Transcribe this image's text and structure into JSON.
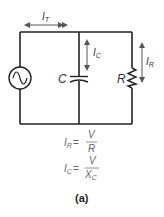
{
  "diagram": {
    "type": "parallel RC circuit",
    "labels": {
      "total_current": {
        "main": "I",
        "sub": "T"
      },
      "capacitor_current": {
        "main": "I",
        "sub": "C"
      },
      "resistor_current": {
        "main": "I",
        "sub": "R"
      },
      "capacitor": "C",
      "resistor": "R",
      "source": "AC source"
    },
    "formulas": [
      {
        "lhs_main": "I",
        "lhs_sub": "R",
        "eq": "=",
        "numerator": "V",
        "denominator_main": "R",
        "denominator_sub": ""
      },
      {
        "lhs_main": "I",
        "lhs_sub": "C",
        "eq": "=",
        "numerator": "V",
        "denominator_main": "X",
        "denominator_sub": "C"
      }
    ],
    "caption": "(a)",
    "colors": {
      "wire": "#222222",
      "arrow": "#555555",
      "formula_text": "#666666"
    }
  }
}
